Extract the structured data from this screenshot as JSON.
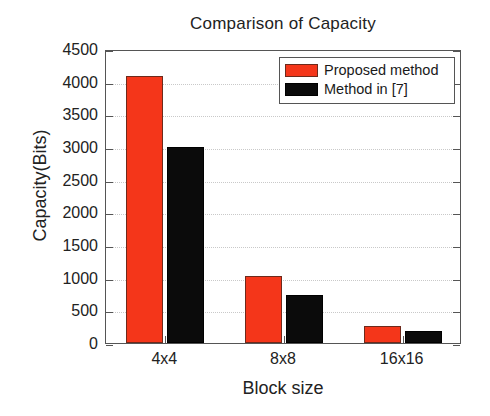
{
  "chart_data": {
    "type": "bar",
    "title": "Comparison of Capacity",
    "xlabel": "Block size",
    "ylabel": "Capacity(Bits)",
    "categories": [
      "4x4",
      "8x8",
      "16x16"
    ],
    "series": [
      {
        "name": "Proposed method",
        "color": "#F4361A",
        "values": [
          4080,
          1020,
          260
        ]
      },
      {
        "name": "Method in [7]",
        "color": "#0B0B0B",
        "values": [
          3000,
          740,
          185
        ]
      }
    ],
    "ylim": [
      0,
      4500
    ],
    "ytick_step": 500,
    "yticks": [
      0,
      500,
      1000,
      1500,
      2000,
      2500,
      3000,
      3500,
      4000,
      4500
    ],
    "ytick_labels": [
      "0",
      "500",
      "1000",
      "1500",
      "2000",
      "2500",
      "3000",
      "3500",
      "4000",
      "4500"
    ],
    "grid": true,
    "legend_position": "top-right",
    "legend_entries": [
      "Proposed method",
      "Method in [7]"
    ]
  }
}
